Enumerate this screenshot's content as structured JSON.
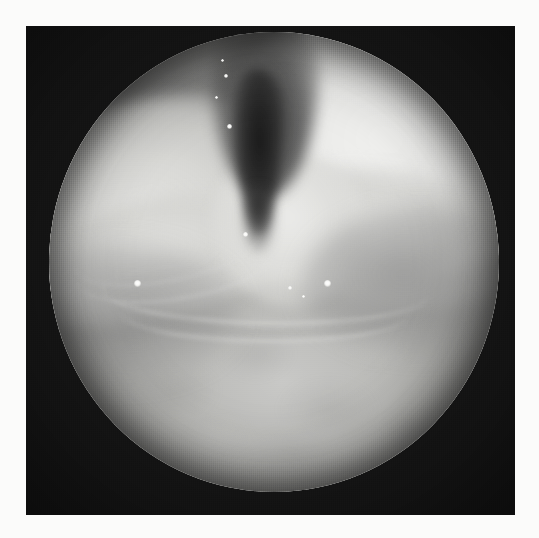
{
  "image": {
    "kind": "endoscopic-photograph",
    "modality_label": "laryngoscopy",
    "color_mode": "grayscale",
    "width_px": 539,
    "height_px": 538,
    "border": {
      "color": "#fbfbfa",
      "inset_px": 26
    },
    "plate": {
      "color": "#151515",
      "left_px": 26,
      "top_px": 26,
      "width_px": 489,
      "height_px": 489
    },
    "scope_field": {
      "shape": "circle",
      "center_x_px": 274,
      "center_y_px": 262,
      "radius_x_px": 225,
      "radius_y_px": 230,
      "mean_tone": "#b0b0ad"
    },
    "palette": {
      "backdrop_black": "#151515",
      "paper_white": "#fbfbfa",
      "tissue_bright": "#ececea",
      "tissue_mid": "#b4b4b1",
      "tissue_shadow": "#7e7e7c",
      "airway_dark": "#2c2c2c",
      "specular_white": "#ffffff"
    }
  },
  "regions": [
    {
      "name": "airway-lumen",
      "label": "dark vertical airway slit",
      "tone": "#2c2c2c"
    },
    {
      "name": "left-fold",
      "label": "upper-left bright mucosal fold",
      "tone": "#d9d9d6"
    },
    {
      "name": "right-fold",
      "label": "upper-right bright mucosal fold",
      "tone": "#f2f2f0"
    },
    {
      "name": "central-wedge",
      "label": "central bright wedge",
      "tone": "#ececea"
    },
    {
      "name": "lower-mucosa",
      "label": "lower mottled mucosal surface",
      "tone": "#b9b9b6"
    },
    {
      "name": "transverse-ridge",
      "label": "transverse mucosal ridge",
      "tone": "#e4e4e2"
    }
  ],
  "specular_highlights": [
    {
      "name": "specular-1",
      "x_px": 137,
      "y_px": 283,
      "size_px": 7
    },
    {
      "name": "specular-2",
      "x_px": 327,
      "y_px": 283,
      "size_px": 7
    },
    {
      "name": "specular-3",
      "x_px": 245,
      "y_px": 234,
      "size_px": 5
    },
    {
      "name": "specular-4",
      "x_px": 290,
      "y_px": 288,
      "size_px": 4
    },
    {
      "name": "specular-5",
      "x_px": 226,
      "y_px": 76,
      "size_px": 4
    },
    {
      "name": "specular-6",
      "x_px": 229,
      "y_px": 126,
      "size_px": 5
    },
    {
      "name": "specular-7",
      "x_px": 222,
      "y_px": 60,
      "size_px": 3
    },
    {
      "name": "specular-8",
      "x_px": 216,
      "y_px": 97,
      "size_px": 3
    },
    {
      "name": "specular-9",
      "x_px": 303,
      "y_px": 296,
      "size_px": 3
    }
  ]
}
